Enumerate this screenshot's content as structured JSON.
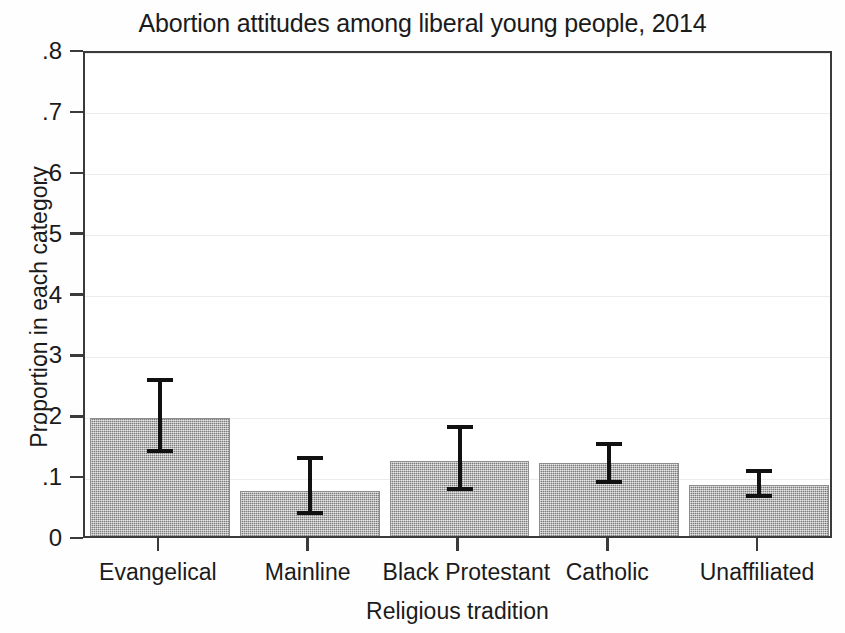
{
  "chart_data": {
    "type": "bar",
    "title": "Abortion attitudes among liberal young people, 2014",
    "xlabel": "Religious tradition",
    "ylabel": "Proportion in each category",
    "categories": [
      "Evangelical",
      "Mainline",
      "Black Protestant",
      "Catholic",
      "Unaffiliated"
    ],
    "values": [
      0.2,
      0.081,
      0.129,
      0.126,
      0.09
    ],
    "error_low": [
      0.147,
      0.045,
      0.083,
      0.095,
      0.072
    ],
    "error_high": [
      0.263,
      0.134,
      0.186,
      0.158,
      0.113
    ],
    "ylim": [
      0,
      0.8
    ],
    "ytick_values": [
      0,
      0.1,
      0.2,
      0.3,
      0.4,
      0.5,
      0.6,
      0.7,
      0.8
    ],
    "ytick_labels": [
      "0",
      ".1",
      ".2",
      ".3",
      ".4",
      ".5",
      ".6",
      ".7",
      ".8"
    ],
    "grid": true,
    "legend": "none",
    "bar_color": "#9d9d9d",
    "error_color": "#111111",
    "axis_color": "#3a3a3a",
    "gridline_color": "#ececec"
  }
}
